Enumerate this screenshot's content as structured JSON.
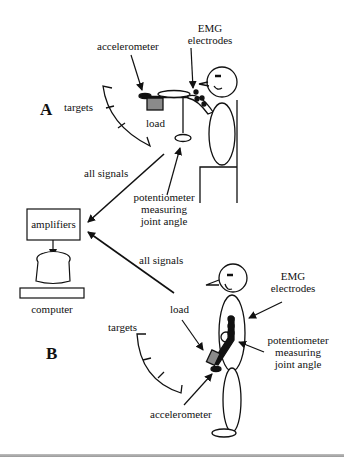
{
  "figure": {
    "panels": [
      {
        "id": "A",
        "label": "A",
        "posture": "seated",
        "labels": {
          "accelerometer": "accelerometer",
          "emg_line1": "EMG",
          "emg_line2": "electrodes",
          "targets": "targets",
          "load": "load",
          "signals": "all signals",
          "pot_line1": "potentiometer",
          "pot_line2": "measuring",
          "pot_line3": "joint angle"
        }
      },
      {
        "id": "B",
        "label": "B",
        "posture": "standing",
        "labels": {
          "accelerometer": "accelerometer",
          "emg_line1": "EMG",
          "emg_line2": "electrodes",
          "targets": "targets",
          "load": "load",
          "signals": "all signals",
          "pot_line1": "potentiometer",
          "pot_line2": "measuring",
          "pot_line3": "joint angle"
        }
      }
    ],
    "equipment": {
      "amplifiers": "amplifiers",
      "computer": "computer"
    },
    "colors": {
      "ink": "#111111",
      "load_fill": "#8a8a8a",
      "background": "#ffffff"
    }
  }
}
